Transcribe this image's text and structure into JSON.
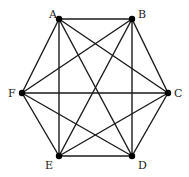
{
  "graph": {
    "type": "complete-graph",
    "nodes": [
      {
        "id": "A",
        "x": 59,
        "y": 19,
        "lx": 49,
        "ly": 18
      },
      {
        "id": "B",
        "x": 132,
        "y": 19,
        "lx": 138,
        "ly": 18
      },
      {
        "id": "C",
        "x": 168,
        "y": 93,
        "lx": 174,
        "ly": 97
      },
      {
        "id": "D",
        "x": 132,
        "y": 156,
        "lx": 138,
        "ly": 169
      },
      {
        "id": "E",
        "x": 59,
        "y": 156,
        "lx": 45,
        "ly": 169
      },
      {
        "id": "F",
        "x": 22,
        "y": 93,
        "lx": 8,
        "ly": 97
      }
    ],
    "edges": [
      [
        "A",
        "B"
      ],
      [
        "A",
        "C"
      ],
      [
        "A",
        "D"
      ],
      [
        "A",
        "E"
      ],
      [
        "A",
        "F"
      ],
      [
        "B",
        "C"
      ],
      [
        "B",
        "D"
      ],
      [
        "B",
        "E"
      ],
      [
        "B",
        "F"
      ],
      [
        "C",
        "D"
      ],
      [
        "C",
        "E"
      ],
      [
        "C",
        "F"
      ],
      [
        "D",
        "E"
      ],
      [
        "D",
        "F"
      ],
      [
        "E",
        "F"
      ]
    ],
    "colors": {
      "edge": "#1a1a1a",
      "node": "#000000",
      "label": "#222222"
    }
  }
}
